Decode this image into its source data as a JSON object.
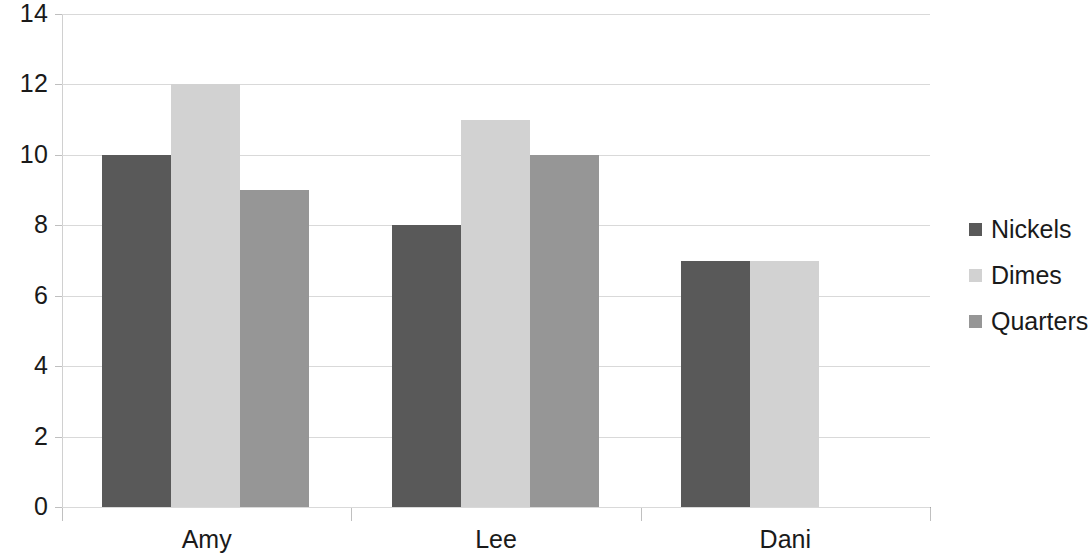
{
  "chart_data": {
    "type": "bar",
    "title": "",
    "subtitle": "",
    "xlabel": "",
    "ylabel": "",
    "categories": [
      "Amy",
      "Lee",
      "Dani"
    ],
    "series": [
      {
        "name": "Nickels",
        "values": [
          10,
          8,
          7
        ],
        "color": "#595959"
      },
      {
        "name": "Dimes",
        "values": [
          12,
          11,
          7
        ],
        "color": "#d2d2d2"
      },
      {
        "name": "Quarters",
        "values": [
          9,
          10,
          null
        ],
        "color": "#969696"
      }
    ],
    "ylim": [
      0,
      14
    ],
    "yticks": [
      0,
      2,
      4,
      6,
      8,
      10,
      12,
      14
    ],
    "ytick_labels": [
      "0",
      "2",
      "4",
      "6",
      "8",
      "10",
      "12",
      "14"
    ],
    "grid": true,
    "grid_color": "#d9d9d9",
    "legend_position": "right",
    "legend": [
      "Nickels",
      "Dimes",
      "Quarters"
    ],
    "background_color": "#ffffff",
    "axis_color": "#a6a6a6"
  }
}
